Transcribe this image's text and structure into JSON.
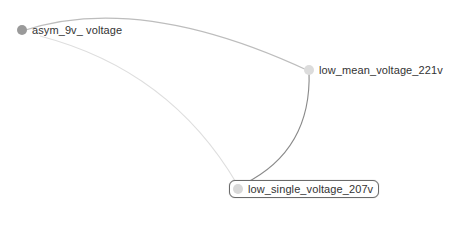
{
  "graph": {
    "nodes": [
      {
        "id": "n1",
        "label": "asym_9v_ voltage",
        "color": "#9a9a9a",
        "x": 22,
        "y": 31,
        "selected": false
      },
      {
        "id": "n2",
        "label": "low_mean_voltage_221v",
        "color": "#dcdcdc",
        "x": 309,
        "y": 71,
        "selected": false
      },
      {
        "id": "n3",
        "label": "low_single_voltage_207v",
        "color": "#d8d8d8",
        "x": 237,
        "y": 189,
        "selected": true
      }
    ],
    "edges": [
      {
        "from": "n1",
        "to": "n2",
        "color": "#bdbdbd"
      },
      {
        "from": "n1",
        "to": "n3",
        "color": "#dedede"
      },
      {
        "from": "n2",
        "to": "n3",
        "color": "#8a8a8a"
      }
    ]
  }
}
